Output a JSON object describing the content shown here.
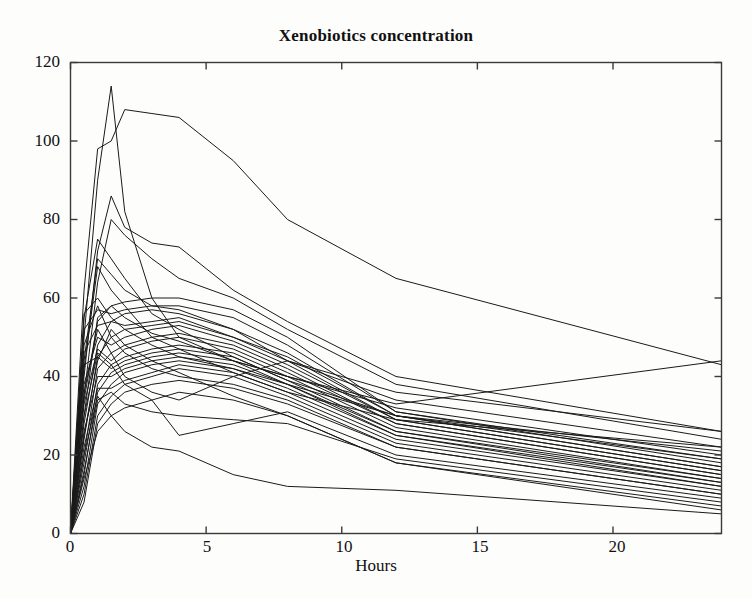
{
  "figure": {
    "title": "Xenobiotics concentration",
    "background_color": "#fdfdfc",
    "line_color": "#1a1a1a",
    "axis_color": "#3a3a3a"
  },
  "axes": {
    "x_label": "Hours",
    "y_label": "",
    "x_ticks": [
      "0",
      "5",
      "10",
      "15",
      "20"
    ],
    "y_ticks": [
      "0",
      "20",
      "40",
      "60",
      "80",
      "100",
      "120"
    ]
  },
  "chart_data": {
    "type": "line",
    "title": "Xenobiotics concentration",
    "xlabel": "Hours",
    "ylabel": "",
    "xlim": [
      0,
      24
    ],
    "ylim": [
      0,
      120
    ],
    "xticks": [
      0,
      5,
      10,
      15,
      20
    ],
    "yticks": [
      0,
      20,
      40,
      60,
      80,
      100,
      120
    ],
    "grid": false,
    "legend": "none",
    "annotations": [],
    "x": [
      0,
      0.5,
      1,
      1.5,
      2,
      3,
      4,
      6,
      8,
      12,
      24
    ],
    "series": [
      {
        "name": "subject-01",
        "values": [
          0,
          50,
          90,
          114,
          82,
          60,
          50,
          44,
          40,
          32,
          20
        ]
      },
      {
        "name": "subject-02",
        "values": [
          0,
          62,
          98,
          100,
          108,
          107,
          106,
          95,
          80,
          65,
          43
        ]
      },
      {
        "name": "subject-03",
        "values": [
          0,
          40,
          72,
          86,
          78,
          74,
          73,
          62,
          54,
          40,
          26
        ]
      },
      {
        "name": "subject-04",
        "values": [
          0,
          35,
          64,
          80,
          76,
          70,
          65,
          60,
          52,
          38,
          24
        ]
      },
      {
        "name": "subject-05",
        "values": [
          0,
          44,
          70,
          66,
          62,
          58,
          57,
          52,
          44,
          34,
          22
        ]
      },
      {
        "name": "subject-06",
        "values": [
          0,
          30,
          55,
          58,
          59,
          60,
          60,
          57,
          50,
          31,
          19
        ]
      },
      {
        "name": "subject-07",
        "values": [
          0,
          52,
          57,
          56,
          57,
          58,
          58,
          55,
          48,
          31,
          18
        ]
      },
      {
        "name": "subject-08",
        "values": [
          0,
          28,
          48,
          54,
          56,
          57,
          56,
          52,
          46,
          30,
          17
        ]
      },
      {
        "name": "subject-09",
        "values": [
          0,
          46,
          53,
          54,
          53,
          54,
          55,
          50,
          45,
          30,
          17
        ]
      },
      {
        "name": "subject-10",
        "values": [
          0,
          24,
          45,
          50,
          52,
          53,
          54,
          50,
          44,
          29,
          16
        ]
      },
      {
        "name": "subject-11",
        "values": [
          0,
          38,
          50,
          48,
          50,
          52,
          53,
          49,
          43,
          29,
          16
        ]
      },
      {
        "name": "subject-12",
        "values": [
          0,
          20,
          42,
          46,
          48,
          50,
          51,
          48,
          42,
          28,
          15
        ]
      },
      {
        "name": "subject-13",
        "values": [
          0,
          33,
          47,
          44,
          47,
          49,
          50,
          47,
          41,
          28,
          15
        ]
      },
      {
        "name": "subject-14",
        "values": [
          0,
          18,
          38,
          43,
          45,
          47,
          48,
          46,
          40,
          27,
          14
        ]
      },
      {
        "name": "subject-15",
        "values": [
          0,
          43,
          45,
          42,
          44,
          46,
          47,
          45,
          39,
          26,
          14
        ]
      },
      {
        "name": "subject-16",
        "values": [
          0,
          15,
          36,
          41,
          43,
          45,
          46,
          44,
          38,
          26,
          13
        ]
      },
      {
        "name": "subject-17",
        "values": [
          0,
          26,
          40,
          40,
          42,
          44,
          45,
          43,
          38,
          25,
          13
        ]
      },
      {
        "name": "subject-18",
        "values": [
          0,
          12,
          33,
          38,
          41,
          43,
          44,
          42,
          37,
          25,
          12
        ]
      },
      {
        "name": "subject-19",
        "values": [
          0,
          22,
          37,
          37,
          39,
          41,
          43,
          41,
          36,
          24,
          12
        ]
      },
      {
        "name": "subject-20",
        "values": [
          0,
          10,
          30,
          35,
          38,
          40,
          42,
          40,
          35,
          23,
          11
        ]
      },
      {
        "name": "subject-21",
        "values": [
          0,
          48,
          58,
          50,
          46,
          42,
          40,
          38,
          34,
          22,
          10
        ]
      },
      {
        "name": "subject-22",
        "values": [
          0,
          8,
          28,
          33,
          36,
          38,
          39,
          37,
          33,
          22,
          10
        ]
      },
      {
        "name": "subject-23",
        "values": [
          0,
          36,
          52,
          46,
          40,
          36,
          34,
          40,
          44,
          36,
          26
        ]
      },
      {
        "name": "subject-24",
        "values": [
          0,
          30,
          46,
          43,
          38,
          34,
          25,
          28,
          31,
          20,
          9
        ]
      },
      {
        "name": "subject-25",
        "values": [
          0,
          16,
          34,
          36,
          33,
          31,
          30,
          29,
          28,
          19,
          8
        ]
      },
      {
        "name": "subject-26",
        "values": [
          0,
          56,
          60,
          55,
          52,
          48,
          45,
          42,
          38,
          30,
          21
        ]
      },
      {
        "name": "subject-27",
        "values": [
          0,
          14,
          26,
          30,
          32,
          34,
          36,
          34,
          30,
          18,
          7
        ]
      },
      {
        "name": "subject-28",
        "values": [
          0,
          25,
          44,
          52,
          48,
          44,
          41,
          35,
          30,
          18,
          6
        ]
      },
      {
        "name": "subject-29",
        "values": [
          0,
          20,
          35,
          30,
          26,
          22,
          21,
          15,
          12,
          11,
          5
        ]
      },
      {
        "name": "subject-30",
        "values": [
          0,
          42,
          68,
          62,
          58,
          50,
          47,
          41,
          36,
          29,
          22
        ]
      },
      {
        "name": "subject-31",
        "values": [
          0,
          55,
          75,
          70,
          65,
          56,
          52,
          45,
          39,
          30,
          19
        ]
      },
      {
        "name": "subject-32",
        "values": [
          0,
          34,
          54,
          58,
          55,
          51,
          49,
          44,
          40,
          33,
          44
        ]
      }
    ]
  }
}
